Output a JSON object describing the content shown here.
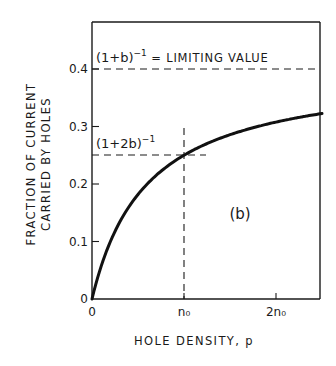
{
  "chart_data": {
    "type": "line",
    "title": "",
    "panel_label": "(b)",
    "xlabel": "HOLE DENSITY, p",
    "ylabel_line1": "FRACTION OF CURRENT",
    "ylabel_line2": "CARRIED BY HOLES",
    "xlim": [
      0,
      2.5
    ],
    "ylim": [
      0,
      0.45
    ],
    "grid": false,
    "legend": null,
    "x_ticks": [
      {
        "value": 0,
        "label": "0"
      },
      {
        "value": 1,
        "label": "n₀"
      },
      {
        "value": 2,
        "label": "2n₀"
      }
    ],
    "y_ticks": [
      {
        "value": 0,
        "label": "0"
      },
      {
        "value": 0.1,
        "label": "0.1"
      },
      {
        "value": 0.2,
        "label": "0.2"
      },
      {
        "value": 0.3,
        "label": "0.3"
      },
      {
        "value": 0.4,
        "label": "0.4"
      }
    ],
    "series": [
      {
        "name": "fraction of current carried by holes",
        "formula": "f(p) = p / ((1+b) p + b n0), b = 1.5",
        "x": [
          0,
          0.05,
          0.1,
          0.2,
          0.3,
          0.4,
          0.5,
          0.6,
          0.8,
          1.0,
          1.2,
          1.5,
          1.8,
          2.0,
          2.2,
          2.5
        ],
        "y": [
          0,
          0.029,
          0.051,
          0.084,
          0.107,
          0.123,
          0.136,
          0.146,
          0.16,
          0.25,
          0.0,
          0.0,
          0.0,
          0.0,
          0.0,
          0.0
        ]
      }
    ],
    "annotations": [
      {
        "text_base": "(1+b)",
        "text_sup": "−1",
        "text_rest": " = LIMITING VALUE",
        "y": 0.4,
        "style": "dashed-horizontal"
      },
      {
        "text_base": "(1+2b)",
        "text_sup": "−1",
        "text_rest": "",
        "y": 0.25,
        "x_end": 1.0,
        "style": "dashed-crosshair"
      }
    ],
    "b": 1.5,
    "limit_value": 0.4,
    "value_at_n0": 0.25
  }
}
